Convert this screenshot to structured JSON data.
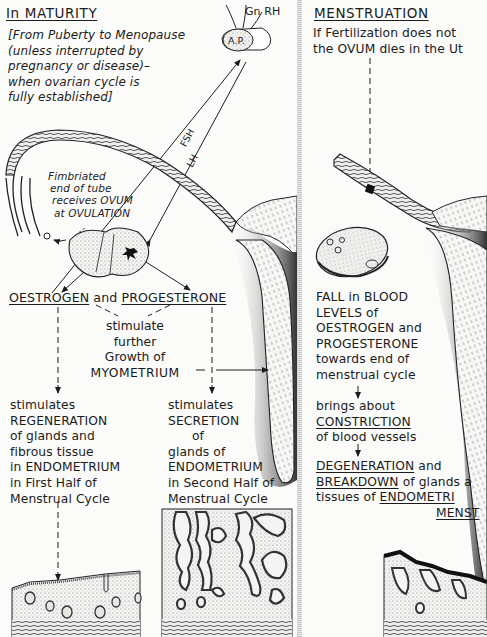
{
  "left_panel": {
    "heading": "In  MATURITY",
    "subtitle_lines": [
      "[From Puberty to Menopause",
      "(unless interrupted by",
      "pregnancy or disease)–",
      "when ovarian cycle is",
      "fully established]"
    ],
    "labels": {
      "gnrh": "Gn RH",
      "ap": "A.P.",
      "fsh": "FSH",
      "lh": "LH",
      "fimbriated": [
        "Fimbriated",
        "end of tube",
        "receives OVUM",
        "at OVULATION"
      ]
    },
    "hormones": {
      "oestrogen": "OESTROGEN",
      "and": " and ",
      "progesterone": "PROGESTERONE"
    },
    "myometrium_box": [
      "stimulate",
      "further",
      "Growth of",
      "MYOMETRIUM"
    ],
    "first_half": [
      "stimulates",
      "REGENERATION",
      "of glands and",
      "fibrous tissue",
      "in ENDOMETRIUM",
      "in First Half of",
      "Menstrual Cycle"
    ],
    "second_half": [
      "stimulates",
      "SECRETION",
      "of",
      "glands of",
      "ENDOMETRIUM",
      "in Second Half of",
      "Menstrual Cycle"
    ]
  },
  "right_panel": {
    "heading": "MENSTRUATION",
    "intro_lines": [
      "If Fertilization does not",
      "the OVUM dies in the Ut"
    ],
    "fall_text": [
      "FALL in BLOOD",
      "LEVELS of",
      "OESTROGEN and",
      "PROGESTERONE",
      "towards end of",
      "menstrual cycle"
    ],
    "constriction": {
      "line1": "brings about",
      "keyword": "CONSTRICTION",
      "line3": "of blood vessels"
    },
    "degeneration": {
      "w1": "DEGENERATION",
      "w1_tail": " and",
      "w2": "BREAKDOWN",
      "w2_tail": " of glands a",
      "w3_head": "tissues of ",
      "w3": "ENDOMETRI",
      "w4": "MENST"
    }
  },
  "colors": {
    "ink": "#1c1c1c",
    "paper": "#fbfbf9",
    "stipple": "#cfcfcf",
    "dark_tissue": "#2a2a2a"
  }
}
